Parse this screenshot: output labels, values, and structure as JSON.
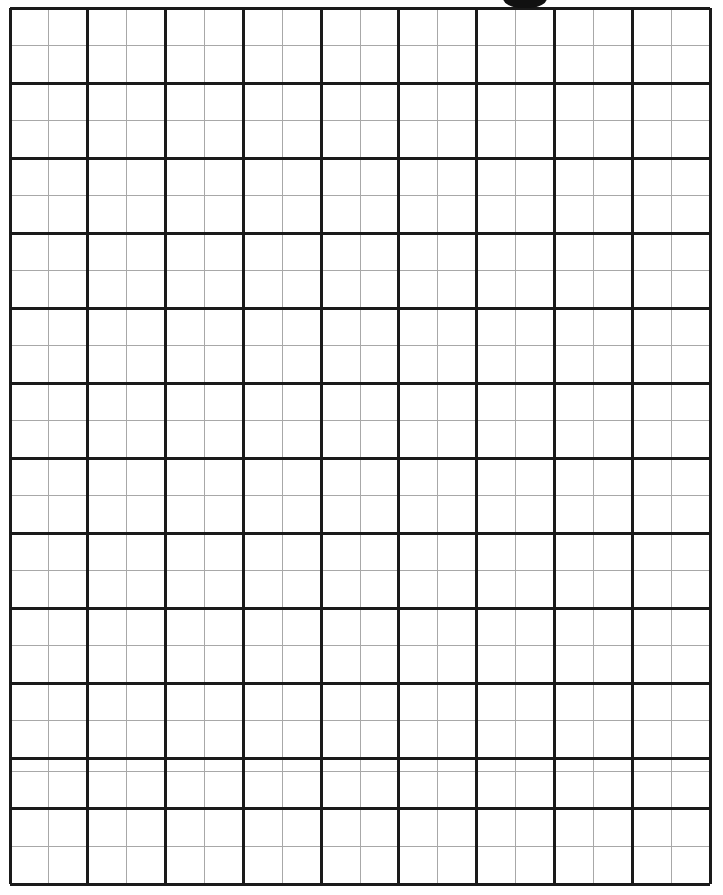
{
  "page": {
    "title": "Blank Grid Worksheet",
    "width": 723,
    "height": 895,
    "background_color": "#ffffff"
  },
  "grid": {
    "name": "graph-paper-grid",
    "origin_x": 10,
    "origin_y": 8,
    "right_x": 710,
    "bottom_y": 884,
    "major_columns": 9,
    "major_rows": 11.67,
    "subdivisions_per_major": 2,
    "minor_columns": 18,
    "minor_rows": 23,
    "major_cell_width": 77.78,
    "major_cell_height": 75.1,
    "minor_cell_width": 38.89,
    "minor_cell_height": 37.55,
    "major_line_color": "#1a1a1a",
    "minor_line_color": "#a8a8a8",
    "major_line_width": 3,
    "minor_line_width": 1,
    "first_row_partial_height": 37.5,
    "major_v_positions": [
      10,
      87.8,
      165.6,
      243.3,
      321.1,
      398.9,
      476.7,
      554.4,
      632.2,
      710
    ],
    "minor_v_positions": [
      48.9,
      126.7,
      204.4,
      282.2,
      360,
      437.8,
      515.6,
      593.3,
      671.1
    ],
    "major_h_positions": [
      8,
      83,
      158,
      233,
      308,
      383,
      458,
      533,
      608,
      683,
      758,
      808,
      884
    ],
    "minor_h_positions": [
      45.5,
      120.5,
      195.5,
      270.5,
      345.5,
      420.5,
      495.5,
      570.5,
      645.5,
      720.5,
      771,
      846
    ]
  },
  "artifact": {
    "name": "top-edge-scan-artifact",
    "label": "dark scan mark clipped by top page edge",
    "x": 503,
    "y": -12,
    "width": 44,
    "height": 20,
    "color": "#111111"
  }
}
